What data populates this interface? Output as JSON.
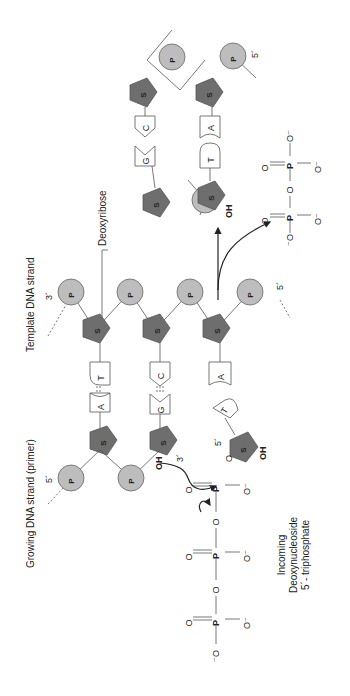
{
  "labels": {
    "growing_strand": "Growing DNA strand (primer)",
    "template_strand": "Template DNA strand",
    "deoxyribose": "Deoxyribose",
    "incoming_1": "Incoming",
    "incoming_2": "Deoxynucleoside",
    "incoming_3": "5´- triphosphate"
  },
  "ends": {
    "growing_5": "5´",
    "growing_3": "3´",
    "template_3": "3´",
    "template_5": "5´",
    "product_5": "5´",
    "incoming_5": "5´"
  },
  "symbols": {
    "phosphate": "P",
    "sugar": "S",
    "hydroxyl": "OH",
    "oxygen": "O",
    "oxygen_neg": "O⁻",
    "neg_oxygen": "⁻O"
  },
  "bases": {
    "pair1_growing": "A",
    "pair1_template": "T",
    "pair2_growing": "G",
    "pair2_template": "C",
    "template_unpaired": "A",
    "incoming": "T",
    "product_pair1_left": "G",
    "product_pair1_right": "C",
    "product_pair2_left": "T",
    "product_pair2_right": "A"
  }
}
